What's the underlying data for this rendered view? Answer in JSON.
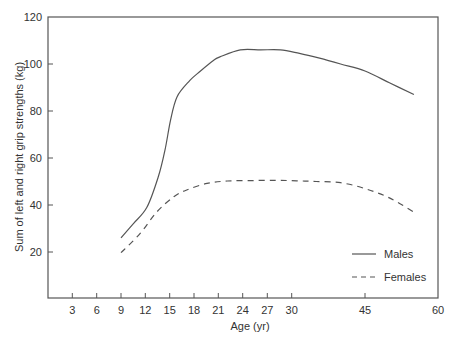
{
  "chart_data": {
    "type": "line",
    "title": "",
    "xlabel": "Age (yr)",
    "ylabel": "Sum of left and right grip strengths (kg)",
    "xlim": [
      0,
      60
    ],
    "ylim": [
      0,
      120
    ],
    "x_ticks": [
      3,
      6,
      9,
      12,
      15,
      18,
      21,
      24,
      27,
      30,
      45,
      60
    ],
    "y_ticks": [
      20,
      40,
      60,
      80,
      100,
      120
    ],
    "x_axis_note": "non-linear age scale: 3-yr steps from 3 to 30, then 15-yr steps to 60",
    "grid": false,
    "legend_position": "lower right inside plot",
    "series": [
      {
        "name": "Males",
        "style": "solid",
        "x": [
          9,
          10.5,
          12.2,
          13.6,
          14.4,
          15.1,
          15.9,
          17.5,
          18.8,
          20.4,
          21.2,
          23.7,
          26.2,
          28.6,
          31.6,
          35.7,
          40,
          45,
          50,
          55
        ],
        "y": [
          26,
          32,
          39,
          52,
          63,
          76,
          86,
          93,
          97,
          101.5,
          103,
          106,
          106,
          106,
          104.5,
          102.5,
          100,
          97,
          92,
          87
        ]
      },
      {
        "name": "Females",
        "style": "dashed",
        "x": [
          9,
          11.4,
          13.4,
          15.5,
          17.1,
          19.6,
          22.1,
          25,
          28,
          31,
          35,
          40,
          45,
          50,
          55
        ],
        "y": [
          19.7,
          28,
          37,
          43.5,
          46.4,
          49.2,
          50.2,
          50.4,
          50.5,
          50.3,
          50,
          49.5,
          47,
          43,
          37
        ]
      }
    ]
  },
  "axes": {
    "x_tick_labels": [
      "3",
      "6",
      "9",
      "12",
      "15",
      "18",
      "21",
      "24",
      "27",
      "30",
      "45",
      "60"
    ],
    "y_tick_labels": [
      "20",
      "40",
      "60",
      "80",
      "100",
      "120"
    ],
    "xlabel": "Age (yr)",
    "ylabel": "Sum of left and right grip strengths (kg)"
  },
  "legend": {
    "items": [
      {
        "label": "Males",
        "style": "solid"
      },
      {
        "label": "Females",
        "style": "dashed"
      }
    ]
  },
  "colors": {
    "axis": "#555555",
    "line": "#555555",
    "text": "#333333"
  }
}
